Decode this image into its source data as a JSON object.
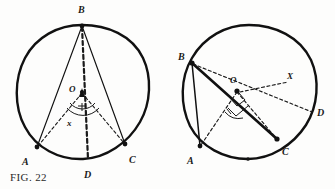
{
  "figure": {
    "caption": "FIG. 22",
    "background_color": "#fdfdfc",
    "ink_color": "#111111"
  },
  "diagrams": [
    {
      "id": "left-diagram",
      "name": "inscribed-angle-central-angle-left",
      "circle": {
        "cx": 82,
        "cy": 92,
        "r": 67
      },
      "center_label": "O",
      "points": [
        {
          "label": "B",
          "x": 82,
          "y": 25,
          "label_x": 78,
          "label_y": 11
        },
        {
          "label": "A",
          "x": 36,
          "y": 148,
          "label_x": 24,
          "label_y": 163
        },
        {
          "label": "C",
          "x": 126,
          "y": 145,
          "label_x": 130,
          "label_y": 161
        },
        {
          "label": "D",
          "x": 89,
          "y": 160,
          "label_x": 85,
          "label_y": 177
        }
      ],
      "angle_label": "x",
      "angle_label_x": 70,
      "angle_label_y": 124,
      "center_label_x": 71,
      "center_label_y": 89,
      "solid_lines": [
        {
          "from": "B",
          "to": "A"
        },
        {
          "from": "B",
          "to": "C"
        }
      ],
      "dashed_lines": [
        {
          "from": "B",
          "to": "D"
        },
        {
          "from": "O",
          "to": "A"
        },
        {
          "from": "O",
          "to": "C"
        }
      ]
    },
    {
      "id": "right-diagram",
      "name": "inscribed-angle-central-angle-right",
      "circle": {
        "cx": 249,
        "cy": 92,
        "r": 67
      },
      "center_label": "O",
      "points": [
        {
          "label": "B",
          "x": 192,
          "y": 62,
          "label_x": 180,
          "label_y": 57
        },
        {
          "label": "A",
          "x": 200,
          "y": 146,
          "label_x": 189,
          "label_y": 163
        },
        {
          "label": "C",
          "x": 277,
          "y": 139,
          "label_x": 283,
          "label_y": 153
        },
        {
          "label": "D",
          "x": 313,
          "y": 112,
          "label_x": 318,
          "label_y": 114
        },
        {
          "label": "X",
          "x": 290,
          "y": 81,
          "label_x": 289,
          "label_y": 79
        }
      ],
      "center_label_x": 231,
      "center_label_y": 80,
      "center_x": 237,
      "center_y": 91,
      "solid_lines": [
        {
          "from": "B",
          "to": "A"
        },
        {
          "from": "B",
          "to": "C"
        }
      ],
      "dashed_lines": [
        {
          "from": "B",
          "to": "D"
        },
        {
          "from": "O",
          "to": "A"
        },
        {
          "from": "O",
          "to": "C"
        },
        {
          "from": "O",
          "to": "X"
        }
      ],
      "right_angle_marks": 2
    }
  ]
}
